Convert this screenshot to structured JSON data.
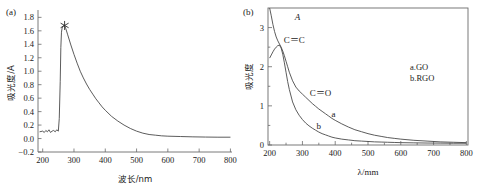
{
  "figure": {
    "panels": [
      {
        "tag": "(a)",
        "xlabel": "波长/nm",
        "ylabel": "吸光度/A",
        "xticks": [
          "200",
          "300",
          "400",
          "500",
          "600",
          "700",
          "800"
        ],
        "yticks": [
          "1.8",
          "1.6",
          "1.4",
          "1.2",
          "1.0",
          "0.8",
          "0.6",
          "0.4",
          "0.2",
          "0.0",
          "−0.2"
        ],
        "marker_label": "peak-star-marker"
      },
      {
        "tag": "(b)",
        "xlabel": "λ/mm",
        "ylabel": "吸光度",
        "xticks": [
          "200",
          "300",
          "400",
          "500",
          "600",
          "700",
          "800"
        ],
        "yticks": [
          "0",
          "1",
          "2",
          "3"
        ],
        "annotations": [
          "A",
          "C＝C",
          "C＝O",
          "a",
          "b"
        ],
        "legend": [
          "a.GO",
          "b.RGO"
        ]
      }
    ]
  },
  "chart_data": [
    {
      "type": "line",
      "panel": "(a)",
      "title": "",
      "xlabel": "波长/nm",
      "ylabel": "吸光度/A",
      "xlim": [
        185,
        805
      ],
      "ylim": [
        -0.2,
        1.85
      ],
      "xticks": [
        200,
        300,
        400,
        500,
        600,
        700,
        800
      ],
      "yticks": [
        -0.2,
        0.0,
        0.2,
        0.4,
        0.6,
        0.8,
        1.0,
        1.2,
        1.4,
        1.6,
        1.8
      ],
      "grid": false,
      "legend": "none",
      "annotations": [
        {
          "text": "★",
          "x": 270,
          "y": 1.68,
          "note": "star marker at absorption peak"
        }
      ],
      "series": [
        {
          "name": "absorbance",
          "x": [
            190,
            200,
            205,
            210,
            215,
            220,
            225,
            230,
            235,
            240,
            245,
            250,
            253,
            256,
            258,
            260,
            262,
            265,
            268,
            270,
            274,
            280,
            290,
            300,
            310,
            320,
            330,
            340,
            350,
            360,
            370,
            380,
            390,
            400,
            420,
            440,
            460,
            480,
            500,
            520,
            540,
            560,
            580,
            600,
            640,
            680,
            720,
            760,
            800
          ],
          "y": [
            0.1,
            0.11,
            0.09,
            0.12,
            0.1,
            0.13,
            0.09,
            0.11,
            0.12,
            0.1,
            0.13,
            0.11,
            0.3,
            0.85,
            1.35,
            1.58,
            1.64,
            1.67,
            1.68,
            1.68,
            1.63,
            1.54,
            1.39,
            1.25,
            1.12,
            1.0,
            0.9,
            0.81,
            0.73,
            0.66,
            0.59,
            0.53,
            0.47,
            0.42,
            0.33,
            0.26,
            0.2,
            0.15,
            0.11,
            0.08,
            0.06,
            0.05,
            0.04,
            0.035,
            0.03,
            0.025,
            0.022,
            0.02,
            0.02
          ]
        }
      ]
    },
    {
      "type": "line",
      "panel": "(b)",
      "title": "",
      "xlabel": "λ/mm",
      "ylabel": "吸光度",
      "xlim": [
        195,
        805
      ],
      "ylim": [
        0,
        3.5
      ],
      "xticks": [
        200,
        300,
        400,
        500,
        600,
        700,
        800
      ],
      "yticks": [
        0,
        1,
        2,
        3
      ],
      "grid": false,
      "legend": "a.GO / b.RGO",
      "annotations": [
        {
          "text": "A",
          "x": 285,
          "y": 3.2
        },
        {
          "text": "C＝C",
          "x": 275,
          "y": 2.6
        },
        {
          "text": "C＝O",
          "x": 355,
          "y": 1.25
        },
        {
          "text": "a",
          "x": 395,
          "y": 0.72
        },
        {
          "text": "b",
          "x": 350,
          "y": 0.42
        }
      ],
      "series": [
        {
          "name": "a.GO",
          "x": [
            200,
            205,
            210,
            215,
            220,
            225,
            230,
            235,
            240,
            245,
            250,
            255,
            260,
            270,
            280,
            290,
            300,
            310,
            320,
            330,
            340,
            350,
            360,
            370,
            380,
            390,
            400,
            420,
            440,
            460,
            480,
            500,
            520,
            540,
            560,
            580,
            600,
            640,
            680,
            720,
            760,
            800
          ],
          "y": [
            3.5,
            3.3,
            3.08,
            2.9,
            2.76,
            2.66,
            2.58,
            2.5,
            2.4,
            2.28,
            2.14,
            2.0,
            1.86,
            1.64,
            1.48,
            1.38,
            1.3,
            1.22,
            1.14,
            1.06,
            0.99,
            0.92,
            0.86,
            0.8,
            0.74,
            0.68,
            0.63,
            0.54,
            0.46,
            0.39,
            0.34,
            0.29,
            0.25,
            0.22,
            0.19,
            0.17,
            0.15,
            0.12,
            0.1,
            0.08,
            0.07,
            0.06
          ]
        },
        {
          "name": "b.RGO",
          "x": [
            200,
            205,
            210,
            215,
            220,
            225,
            230,
            235,
            240,
            245,
            250,
            255,
            260,
            270,
            280,
            290,
            300,
            310,
            320,
            330,
            340,
            350,
            360,
            370,
            380,
            390,
            400,
            420,
            440,
            460,
            480,
            500,
            520,
            540,
            560,
            580,
            600,
            640,
            680,
            720,
            760,
            800
          ],
          "y": [
            2.22,
            2.3,
            2.38,
            2.45,
            2.5,
            2.54,
            2.55,
            2.48,
            2.32,
            2.1,
            1.86,
            1.62,
            1.42,
            1.1,
            0.9,
            0.76,
            0.65,
            0.56,
            0.49,
            0.43,
            0.38,
            0.33,
            0.29,
            0.26,
            0.23,
            0.2,
            0.18,
            0.15,
            0.13,
            0.11,
            0.1,
            0.09,
            0.08,
            0.075,
            0.07,
            0.065,
            0.06,
            0.055,
            0.05,
            0.048,
            0.045,
            0.045
          ]
        }
      ]
    }
  ]
}
